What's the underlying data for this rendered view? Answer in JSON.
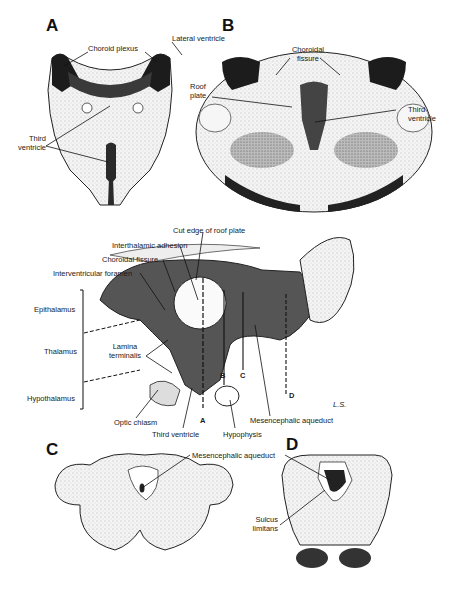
{
  "panels": {
    "A": {
      "letter": "A",
      "labels": {
        "choroid_plexus": "Choroid plexus",
        "lateral_ventricle": "Lateral ventricle",
        "third_ventricle_l1": "Third",
        "third_ventricle_l2": "ventricle"
      }
    },
    "B": {
      "letter": "B",
      "labels": {
        "choroidal_fissure_l1": "Choroidal",
        "choroidal_fissure_l2": "fissure",
        "roof_plate_l1": "Roof",
        "roof_plate_l2": "plate",
        "third_ventricle_l1": "Third",
        "third_ventricle_l2": "ventricle"
      }
    },
    "sagittal": {
      "labels": {
        "cut_edge_roof_plate": "Cut edge of roof plate",
        "interthalamic_adhesion": "Interthalamic adhesion",
        "choroidal_fissure": "Choroidal fissure",
        "interventricular_foramen": "Interventricular foramen",
        "epithalamus": "Epithalamus",
        "thalamus": "Thalamus",
        "hypothalamus": "Hypothalamus",
        "lamina_terminalis_l1": "Lamina",
        "lamina_terminalis_l2": "terminalis",
        "optic_chiasm": "Optic chiasm",
        "third_ventricle": "Third ventricle",
        "hypophysis": "Hypophysis",
        "mesencephalic_aqueduct": "Mesencephalic aqueduct",
        "section_A": "A",
        "section_B": "B",
        "section_C": "C",
        "section_D": "D",
        "ls": "L.S."
      }
    },
    "C": {
      "letter": "C",
      "labels": {
        "mesencephalic_aqueduct": "Mesencephalic aqueduct"
      }
    },
    "D": {
      "letter": "D",
      "labels": {
        "sulcus_limitans_l1": "Sulcus",
        "sulcus_limitans_l2": "limitans"
      }
    }
  }
}
